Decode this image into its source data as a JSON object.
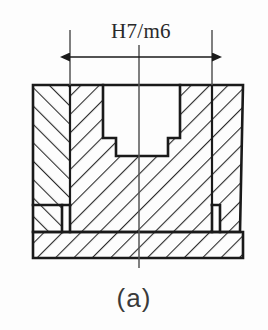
{
  "figure": {
    "caption": "(a)",
    "dimension_label": "H7/m6",
    "type": "engineering-cross-section",
    "colors": {
      "line": "#1a1a1a",
      "hatch": "#2b2b2b",
      "background": "#fdfdfd",
      "text": "#2a2a2a",
      "caption": "#3a3a3a",
      "centerline": "#555555"
    },
    "geometry": {
      "housing": {
        "left": 33,
        "right": 243,
        "top": 85,
        "bottom": 232,
        "body_left": 33,
        "body_right": 240
      },
      "base_plate": {
        "left": 33,
        "right": 243,
        "top": 232,
        "bottom": 258
      },
      "bore_upper": {
        "left": 103,
        "right": 180,
        "top": 85,
        "bottom": 138
      },
      "bore_lower": {
        "left": 116,
        "right": 168,
        "top": 138,
        "bottom": 156
      },
      "part_boundary_left_x": 70,
      "part_boundary_right_x": 212,
      "centerline_x": 139,
      "relief_groove_left": {
        "x": 62,
        "y": 205,
        "width": 8,
        "height": 27
      },
      "relief_groove_right": {
        "x": 212,
        "y": 205,
        "width": 8,
        "height": 27
      }
    },
    "dimension": {
      "y": 57,
      "x_start": 70,
      "x_end": 212,
      "label_y": 38,
      "extension_top": 30,
      "extension_bottom": 180
    }
  }
}
